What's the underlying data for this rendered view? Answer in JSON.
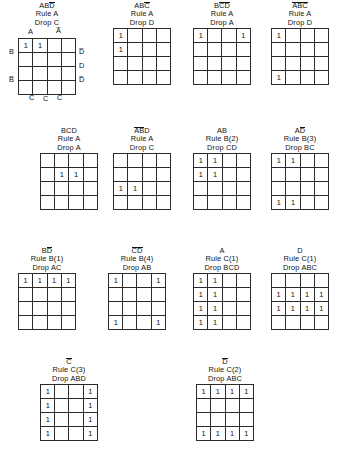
{
  "figure": {
    "type": "karnaugh-map-set",
    "grid_size": {
      "rows": 4,
      "cols": 4
    },
    "cell_mark": "1",
    "axis_labels": {
      "top": [
        "A",
        "A̅"
      ],
      "left": [
        "B",
        "B̅"
      ],
      "right": [
        "D̅",
        "D",
        "D̅"
      ],
      "bottom": [
        "C̅",
        "C",
        "C̅"
      ]
    }
  },
  "maps": [
    {
      "id": "map-0",
      "term_plain": "ABD",
      "term_overbars": [
        false,
        false,
        true
      ],
      "rule": "Rule A",
      "drop": "Drop C",
      "annotated": true,
      "ones": [
        [
          0,
          0
        ],
        [
          0,
          1
        ]
      ]
    },
    {
      "id": "map-1",
      "term_plain": "ABC",
      "term_overbars": [
        false,
        false,
        true
      ],
      "rule": "Rule A",
      "drop": "Drop D",
      "annotated": false,
      "ones": [
        [
          0,
          0
        ],
        [
          1,
          0
        ]
      ]
    },
    {
      "id": "map-2",
      "term_plain": "BCD",
      "term_overbars": [
        false,
        true,
        true
      ],
      "rule": "Rule A",
      "drop": "Drop A",
      "annotated": false,
      "ones": [
        [
          0,
          0
        ],
        [
          0,
          3
        ]
      ]
    },
    {
      "id": "map-3",
      "term_plain": "ABC",
      "term_overbars": [
        true,
        true,
        true
      ],
      "rule": "Rule A",
      "drop": "Drop D",
      "annotated": false,
      "ones": [
        [
          0,
          0
        ],
        [
          3,
          0
        ]
      ]
    },
    {
      "id": "map-4",
      "term_plain": "BCD",
      "term_overbars": [
        false,
        false,
        false
      ],
      "rule": "Rule A",
      "drop": "Drop A",
      "annotated": false,
      "ones": [
        [
          1,
          1
        ],
        [
          1,
          2
        ]
      ]
    },
    {
      "id": "map-5",
      "term_plain": "ABD",
      "term_overbars": [
        true,
        true,
        false
      ],
      "rule": "Rule A",
      "drop": "Drop C",
      "annotated": false,
      "ones": [
        [
          2,
          0
        ],
        [
          2,
          1
        ]
      ]
    },
    {
      "id": "map-6",
      "term_plain": "AB",
      "term_overbars": [
        false,
        false
      ],
      "rule": "Rule B(2)",
      "drop": "Drop CD",
      "annotated": false,
      "ones": [
        [
          0,
          0
        ],
        [
          0,
          1
        ],
        [
          1,
          0
        ],
        [
          1,
          1
        ]
      ]
    },
    {
      "id": "map-7",
      "term_plain": "AD",
      "term_overbars": [
        false,
        true
      ],
      "rule": "Rule B(3)",
      "drop": "Drop BC",
      "annotated": false,
      "ones": [
        [
          0,
          0
        ],
        [
          0,
          1
        ],
        [
          3,
          0
        ],
        [
          3,
          1
        ]
      ]
    },
    {
      "id": "map-8",
      "term_plain": "BD",
      "term_overbars": [
        false,
        true
      ],
      "rule": "Rule B(1)",
      "drop": "Drop AC",
      "annotated": false,
      "ones": [
        [
          0,
          0
        ],
        [
          0,
          1
        ],
        [
          0,
          2
        ],
        [
          0,
          3
        ]
      ]
    },
    {
      "id": "map-9",
      "term_plain": "CD",
      "term_overbars": [
        true,
        true
      ],
      "rule": "Rule B(4)",
      "drop": "Drop AB",
      "annotated": false,
      "ones": [
        [
          0,
          0
        ],
        [
          0,
          3
        ],
        [
          3,
          0
        ],
        [
          3,
          3
        ]
      ]
    },
    {
      "id": "map-10",
      "term_plain": "A",
      "term_overbars": [
        false
      ],
      "rule": "Rule C(1)",
      "drop": "Drop BCD",
      "annotated": false,
      "ones": [
        [
          0,
          0
        ],
        [
          0,
          1
        ],
        [
          1,
          0
        ],
        [
          1,
          1
        ],
        [
          2,
          0
        ],
        [
          2,
          1
        ],
        [
          3,
          0
        ],
        [
          3,
          1
        ]
      ]
    },
    {
      "id": "map-11",
      "term_plain": "D",
      "term_overbars": [
        false
      ],
      "rule": "Rule C(1)",
      "drop": "Drop ABC",
      "annotated": false,
      "ones": [
        [
          1,
          0
        ],
        [
          1,
          1
        ],
        [
          1,
          2
        ],
        [
          1,
          3
        ],
        [
          2,
          0
        ],
        [
          2,
          1
        ],
        [
          2,
          2
        ],
        [
          2,
          3
        ]
      ]
    },
    {
      "id": "map-12",
      "term_plain": "C",
      "term_overbars": [
        true
      ],
      "rule": "Rule C(3)",
      "drop": "Drop ABD",
      "annotated": false,
      "ones": [
        [
          0,
          0
        ],
        [
          0,
          3
        ],
        [
          1,
          0
        ],
        [
          1,
          3
        ],
        [
          2,
          0
        ],
        [
          2,
          3
        ],
        [
          3,
          0
        ],
        [
          3,
          3
        ]
      ]
    },
    {
      "id": "map-13",
      "term_plain": "D",
      "term_overbars": [
        true
      ],
      "rule": "Rule C(2)",
      "drop": "Drop ABC",
      "annotated": false,
      "ones": [
        [
          0,
          0
        ],
        [
          0,
          1
        ],
        [
          0,
          2
        ],
        [
          0,
          3
        ],
        [
          3,
          0
        ],
        [
          3,
          1
        ],
        [
          3,
          2
        ],
        [
          3,
          3
        ]
      ]
    }
  ]
}
